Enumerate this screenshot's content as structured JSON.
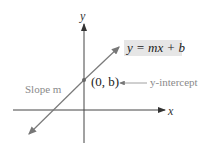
{
  "diagram": {
    "equation_label": "y = mx + b",
    "point_label": "(0, b)",
    "intercept_label": "y-intercept",
    "slope_label": "Slope m",
    "x_axis_label": "x",
    "y_axis_label": "y",
    "colors": {
      "axes": "#444444",
      "line": "#7a7a7a",
      "label_box": "#e6e6e6",
      "annotation_text": "#8a8a8a"
    }
  }
}
